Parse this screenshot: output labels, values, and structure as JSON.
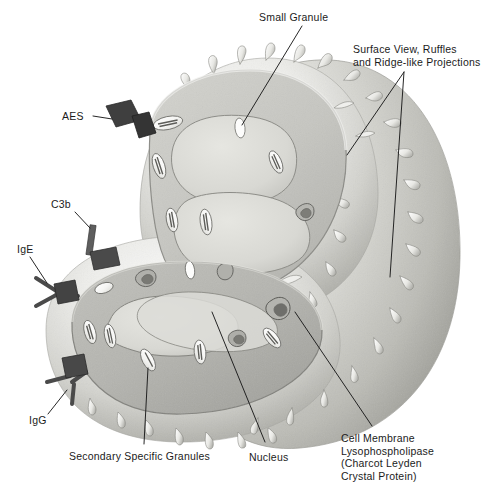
{
  "figure": {
    "palette": {
      "background": "#ffffff",
      "label_text": "#1b1b1b",
      "leader_line": "#1a1a1a",
      "cell_surface_light": "#f2f2f0",
      "cell_surface_mid": "#d6d6d2",
      "cell_surface_shadow": "#a9a9a4",
      "cytoplasm_upper": "#c9c9c4",
      "cytoplasm_lower": "#b4b4af",
      "nucleus_fill": "#dedeD9",
      "membrane_rim": "#8f8f8a",
      "granule_fill": "#fbfbfa",
      "granule_core": "#6f6f6b",
      "receptor_dark": "#3b3b3b",
      "receptor_mid": "#5e5e5e"
    },
    "labels": [
      {
        "id": "small-granule",
        "text": "Small Granule",
        "x": 259,
        "y": 11,
        "align": "left",
        "leader": [
          [
            302,
            26
          ],
          [
            242,
            125
          ]
        ]
      },
      {
        "id": "surface-view-ruffles",
        "text": "Surface View, Ruffles\nand Ridge-like Projections",
        "x": 353,
        "y": 43,
        "align": "left",
        "leader": [
          [
            404,
            72
          ],
          [
            347,
            155
          ]
        ],
        "leader2": [
          [
            404,
            72
          ],
          [
            390,
            277
          ]
        ]
      },
      {
        "id": "aes",
        "text": "AES",
        "x": 62,
        "y": 110,
        "align": "left",
        "leader": [
          [
            93,
            116
          ],
          [
            115,
            120
          ]
        ]
      },
      {
        "id": "c3b",
        "text": "C3b",
        "x": 51,
        "y": 198,
        "align": "left",
        "leader": [
          [
            75,
            212
          ],
          [
            92,
            230
          ]
        ]
      },
      {
        "id": "ige",
        "text": "IgE",
        "x": 17,
        "y": 243,
        "align": "left",
        "leader": [
          [
            30,
            257
          ],
          [
            47,
            283
          ]
        ]
      },
      {
        "id": "igg",
        "text": "IgG",
        "x": 29,
        "y": 418,
        "align": "left",
        "leader": [
          [
            48,
            417
          ],
          [
            66,
            391
          ]
        ]
      },
      {
        "id": "secondary-specific-granules",
        "text": "Secondary Specific Granules",
        "x": 69,
        "y": 450,
        "align": "left",
        "leader": [
          [
            144,
            446
          ],
          [
            148,
            368
          ]
        ]
      },
      {
        "id": "nucleus",
        "text": "Nucleus",
        "x": 249,
        "y": 451,
        "align": "left",
        "leader": [
          [
            265,
            444
          ],
          [
            212,
            312
          ]
        ]
      },
      {
        "id": "cell-membrane-lysophospholipase",
        "text": "Cell Membrane\nLysophospholipase\n(Charcot Leyden\nCrystal Protein)",
        "x": 341,
        "y": 432,
        "align": "left",
        "leader": [
          [
            372,
            428
          ],
          [
            295,
            312
          ]
        ]
      }
    ],
    "structures": [
      {
        "id": "cell-body",
        "name": "eosinophil cell body"
      },
      {
        "id": "surface-microvilli",
        "name": "ridge-like surface projections"
      },
      {
        "id": "upper-cut-face",
        "name": "upper cutaway wedge"
      },
      {
        "id": "lower-cut-face",
        "name": "lower cutaway wedge"
      },
      {
        "id": "nucleus-upper-lobe",
        "name": "nucleus lobe (upper section)"
      },
      {
        "id": "nucleus-lower-lobe",
        "name": "nucleus lobe (lower section)"
      },
      {
        "id": "specific-granules",
        "name": "secondary specific granules with crystalloid core"
      },
      {
        "id": "small-granules",
        "name": "small granules"
      },
      {
        "id": "receptor-aes",
        "name": "AES membrane receptor"
      },
      {
        "id": "receptor-c3b",
        "name": "C3b membrane receptor"
      },
      {
        "id": "receptor-ige",
        "name": "IgE Y-shaped receptor"
      },
      {
        "id": "receptor-igg",
        "name": "IgG Y-shaped receptor"
      }
    ]
  }
}
